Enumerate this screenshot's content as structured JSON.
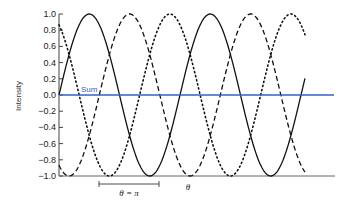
{
  "chart_data": {
    "type": "line",
    "title": "",
    "xlabel": "θ",
    "ylabel": "Intensity",
    "ylim": [
      -1.0,
      1.0
    ],
    "yticks": [
      "1.0",
      "0.8",
      "0.6",
      "0.4",
      "0.2",
      "0.0",
      "-0.2",
      "-0.4",
      "-0.6",
      "-0.8",
      "-1.0"
    ],
    "grid": false,
    "annotations": [
      {
        "text": "Sum",
        "near": "blue horizontal line at 0"
      },
      {
        "text": "θ = π",
        "type": "bracket-span",
        "meaning": "half period span"
      }
    ],
    "period_cycles_shown": 2.04,
    "series": [
      {
        "name": "solid",
        "style": "solid",
        "color": "#111111",
        "function": "sin(θ)"
      },
      {
        "name": "dashed",
        "style": "dashed",
        "color": "#111111",
        "function": "sin(θ - 2π/3)"
      },
      {
        "name": "dotted",
        "style": "dotted",
        "color": "#111111",
        "function": "sin(θ + 2π/3)"
      },
      {
        "name": "Sum",
        "style": "solid",
        "color": "#2f63c4",
        "function": "0"
      }
    ]
  },
  "labels": {
    "ylabel": "Intensity",
    "sum": "Sum",
    "bracket": "θ = π",
    "xlabel": "θ"
  },
  "colors": {
    "sum": "#2f63c4",
    "curves": "#111111",
    "axis": "#555555"
  }
}
